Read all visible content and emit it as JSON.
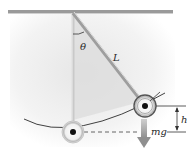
{
  "diagram": {
    "type": "pendulum",
    "labels": {
      "angle": "θ",
      "length": "L",
      "height": "h",
      "weight": "mg"
    },
    "colors": {
      "background": "#ffffff",
      "shade": "#e4e4e4",
      "ceiling": "#8a8a8a",
      "rod": "#c8c8c8",
      "line": "#2b2b2b",
      "bob_fill": "#ececec",
      "bob_center": "#111111",
      "arrow": "#9a9a9a"
    }
  }
}
